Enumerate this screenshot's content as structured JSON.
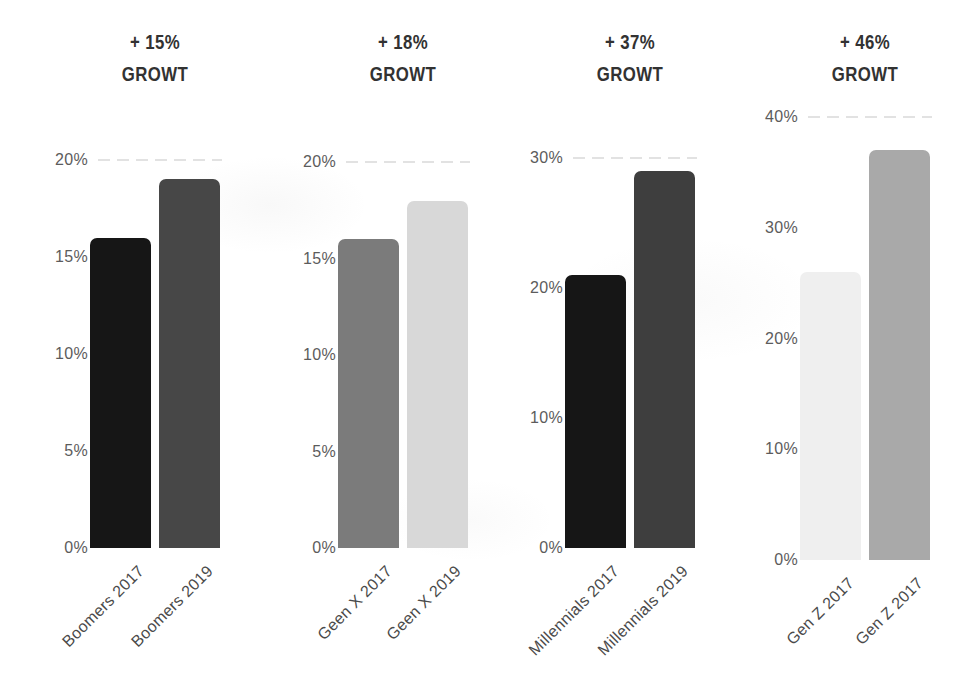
{
  "canvas": {
    "background": "#ffffff",
    "width": 970,
    "height": 689
  },
  "styles": {
    "title_color": "#323232",
    "ytick_color": "#5c5c5c",
    "xlabel_color": "#4a4a4a",
    "gridline_color": "#e2e2e2"
  },
  "chart_data": [
    {
      "type": "bar",
      "id": "boomers",
      "title": "+ 15% GROWT",
      "growth_label": "+ 15%",
      "growth_word": "GROWT",
      "categories": [
        "Boomers 2017",
        "Boomers 2019"
      ],
      "values": [
        16,
        19
      ],
      "value_unit": "%",
      "bar_colors": [
        "#161616",
        "#474747"
      ],
      "yticks": [
        "20%",
        "15%",
        "10%",
        "5%",
        "0%"
      ],
      "ylim": [
        0,
        20
      ],
      "xlabel": "",
      "ylabel": "",
      "grid": "faint dashed line at top tick only",
      "legend": "none"
    },
    {
      "type": "bar",
      "id": "gen-x",
      "title": "+ 18% GROWT",
      "growth_label": "+ 18%",
      "growth_word": "GROWT",
      "categories": [
        "Geen X 2017",
        "Geen X 2019"
      ],
      "values": [
        16,
        18
      ],
      "value_unit": "%",
      "bar_colors": [
        "#7b7b7b",
        "#d8d8d8"
      ],
      "yticks": [
        "20%",
        "15%",
        "10%",
        "5%",
        "0%"
      ],
      "ylim": [
        0,
        20
      ],
      "xlabel": "",
      "ylabel": "",
      "grid": "faint dashed line at top tick only",
      "legend": "none"
    },
    {
      "type": "bar",
      "id": "millennials",
      "title": "+ 37% GROWT",
      "growth_label": "+ 37%",
      "growth_word": "GROWT",
      "categories": [
        "Millennials 2017",
        "Millennials 2019"
      ],
      "values": [
        21,
        29
      ],
      "value_unit": "%",
      "bar_colors": [
        "#161616",
        "#3e3e3e"
      ],
      "yticks": [
        "30%",
        "20%",
        "10%",
        "0%"
      ],
      "ylim": [
        0,
        30
      ],
      "xlabel": "",
      "ylabel": "",
      "grid": "faint dashed line at top tick only",
      "legend": "none"
    },
    {
      "type": "bar",
      "id": "gen-z",
      "title": "+ 46% GROWT",
      "growth_label": "+ 46%",
      "growth_word": "GROWT",
      "categories": [
        "Gen Z 2017",
        "Gen Z 2017"
      ],
      "values": [
        26,
        37
      ],
      "value_unit": "%",
      "bar_colors": [
        "#efefef",
        "#a9a9a9"
      ],
      "yticks": [
        "40%",
        "30%",
        "20%",
        "10%",
        "0%"
      ],
      "ylim": [
        0,
        40
      ],
      "xlabel": "",
      "ylabel": "",
      "grid": "faint dashed line at top tick only",
      "legend": "none"
    }
  ]
}
